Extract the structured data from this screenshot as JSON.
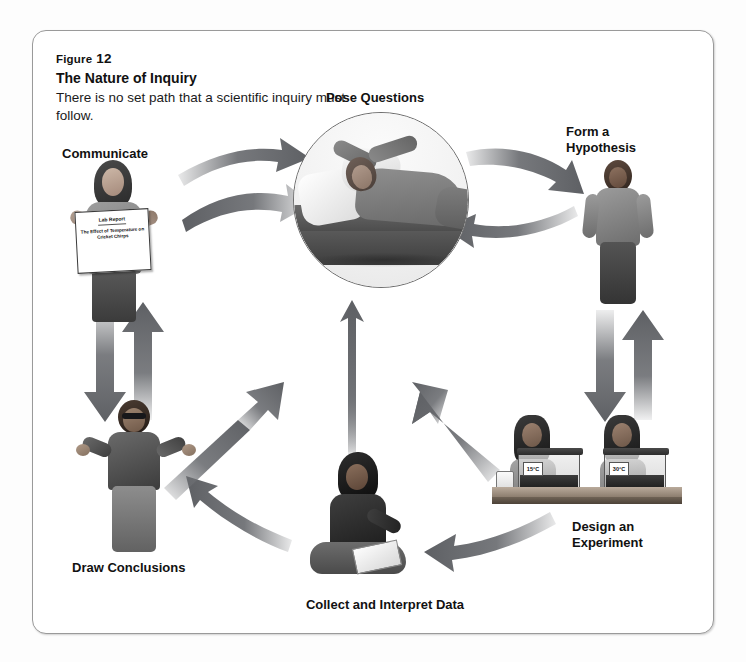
{
  "figure": {
    "number_prefix": "Figure",
    "number": "12",
    "title": "The Nature of Inquiry",
    "description": "There is no set path that a scientific inquiry must follow."
  },
  "nodes": {
    "pose_questions": {
      "label": "Pose Questions",
      "scene": "student lying on cushions with hands behind head, thinking"
    },
    "form_hypothesis": {
      "label": "Form a\nHypothesis",
      "scene": "student standing with hands at sides"
    },
    "design_experiment": {
      "label": "Design an\nExperiment",
      "scene": "two students at a lab bench with two cricket tanks at different temperatures"
    },
    "collect_data": {
      "label": "Collect and Interpret Data",
      "scene": "student sitting cross-legged writing on a clipboard"
    },
    "draw_conclusions": {
      "label": "Draw Conclusions",
      "scene": "student with sunglasses shrugging with open hands"
    },
    "communicate": {
      "label": "Communicate",
      "scene": "student holding up a lab report poster"
    }
  },
  "lab_report_sign": {
    "title": "Lab Report",
    "subtitle": "The Effect of Temperature on Cricket Chirps"
  },
  "experiment_tanks": [
    {
      "temperature_label": "15°C"
    },
    {
      "temperature_label": "30°C"
    }
  ],
  "arrows": [
    {
      "id": "communicate-to-pose",
      "from": "Communicate",
      "to": "Pose Questions",
      "direction": "forward"
    },
    {
      "id": "pose-to-communicate",
      "from": "Pose Questions",
      "to": "Communicate",
      "direction": "reverse"
    },
    {
      "id": "pose-to-hypothesis",
      "from": "Pose Questions",
      "to": "Form a Hypothesis",
      "direction": "forward"
    },
    {
      "id": "hypothesis-to-pose",
      "from": "Form a Hypothesis",
      "to": "Pose Questions",
      "direction": "reverse"
    },
    {
      "id": "communicate-down",
      "from": "Communicate",
      "to": "Draw Conclusions",
      "direction": "forward"
    },
    {
      "id": "conclusions-up",
      "from": "Draw Conclusions",
      "to": "Communicate",
      "direction": "reverse"
    },
    {
      "id": "hypothesis-down",
      "from": "Form a Hypothesis",
      "to": "Design an Experiment",
      "direction": "forward"
    },
    {
      "id": "design-up",
      "from": "Design an Experiment",
      "to": "Form a Hypothesis",
      "direction": "reverse"
    },
    {
      "id": "design-to-collect",
      "from": "Design an Experiment",
      "to": "Collect and Interpret Data",
      "direction": "forward"
    },
    {
      "id": "collect-to-conclusions",
      "from": "Collect and Interpret Data",
      "to": "Draw Conclusions",
      "direction": "forward"
    },
    {
      "id": "conclusions-to-center",
      "from": "Draw Conclusions",
      "to": "Pose Questions",
      "direction": "forward"
    },
    {
      "id": "collect-to-center",
      "from": "Collect and Interpret Data",
      "to": "Pose Questions",
      "direction": "forward"
    },
    {
      "id": "design-to-center",
      "from": "Design an Experiment",
      "to": "Pose Questions",
      "direction": "forward"
    }
  ],
  "colors": {
    "arrow_gray": "#6f7175",
    "frame_border": "#9a9a9a",
    "text": "#111111",
    "page_background": "#ffffff"
  }
}
